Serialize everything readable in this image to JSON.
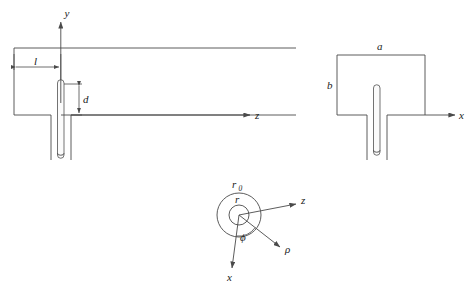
{
  "figure": {
    "background_color": "#ffffff",
    "line_color": "#4a4a4a",
    "label_color": "#1a1a1a"
  },
  "views": {
    "side_view": {
      "name": "longitudinal section",
      "axis_vertical_label": "y",
      "axis_horizontal_label": "z",
      "dimension_probe_offset_label": "l",
      "dimension_probe_length_label": "d"
    },
    "end_view": {
      "name": "transverse section",
      "axis_horizontal_label": "x",
      "dimension_width_label": "a",
      "dimension_height_label": "b"
    },
    "coax_section": {
      "name": "coaxial line cross section",
      "outer_radius_label": "r",
      "outer_radius_subscript": "0",
      "inner_radius_label": "r",
      "axis_horizontal_label": "z",
      "axis_vertical_label": "x",
      "angle_label": "ϕ",
      "radial_label": "ρ"
    }
  }
}
